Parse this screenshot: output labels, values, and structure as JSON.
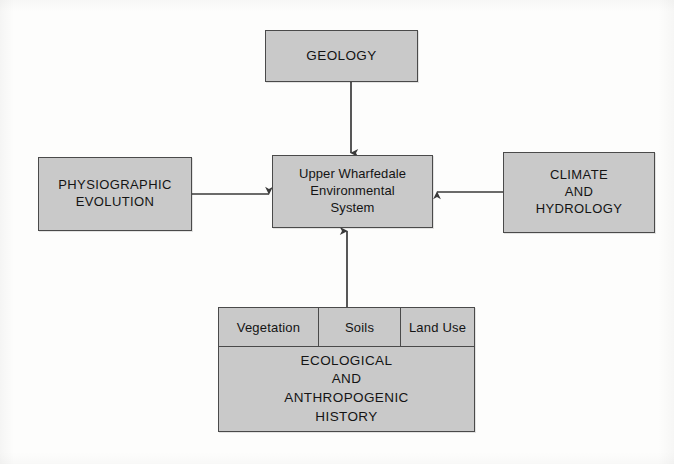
{
  "diagram": {
    "title": "Upper Wharfedale Environmental System",
    "type": "block-flow-diagram",
    "background_color": "#fdfdfc",
    "node_fill_color": "#c9c9c9",
    "node_border_color": "#4a4a4a",
    "text_color": "#141414",
    "nodes": {
      "central": {
        "label": "Upper Wharfedale\nEnvironmental\nSystem",
        "position": "center"
      },
      "geology": {
        "label": "GEOLOGY",
        "position": "top"
      },
      "physiographic": {
        "label": "PHYSIOGRAPHIC\nEVOLUTION",
        "position": "left"
      },
      "climate": {
        "label": "CLIMATE\nAND\nHYDROLOGY",
        "position": "right"
      },
      "ecological": {
        "label": "ECOLOGICAL\nAND\nANTHROPOGENIC\nHISTORY",
        "position": "bottom",
        "subcells": [
          {
            "label": "Vegetation"
          },
          {
            "label": "Soils"
          },
          {
            "label": "Land Use"
          }
        ]
      }
    },
    "arrows": [
      {
        "name": "geology-to-central",
        "from": "geology",
        "to": "central",
        "direction": "down"
      },
      {
        "name": "physiographic-to-central",
        "from": "physiographic",
        "to": "central",
        "direction": "right"
      },
      {
        "name": "climate-to-central",
        "from": "climate",
        "to": "central",
        "direction": "left"
      },
      {
        "name": "ecological-to-central",
        "from": "ecological",
        "to": "central",
        "direction": "up"
      }
    ]
  }
}
